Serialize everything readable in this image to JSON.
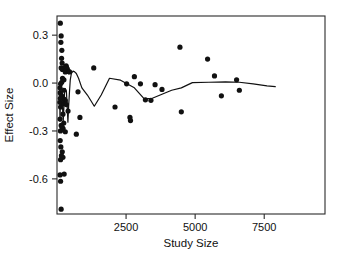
{
  "chart_data": {
    "type": "scatter",
    "title": "",
    "xlabel": "Study Size",
    "ylabel": "Effect Size",
    "xlim": [
      0,
      9700
    ],
    "ylim": [
      -0.82,
      0.42
    ],
    "grid": false,
    "legend": "none",
    "xticks": [
      2500,
      5000,
      7500
    ],
    "xtick_labels": [
      "2500",
      "5000",
      "7500"
    ],
    "yticks": [
      0.3,
      0.0,
      -0.3,
      -0.6
    ],
    "ytick_labels": [
      "0.3",
      "0.0",
      "-0.3",
      "-0.6"
    ],
    "marker": "filled-circle",
    "marker_color": "#111111",
    "line_color": "#111111",
    "series": [
      {
        "name": "studies",
        "type": "scatter",
        "points": [
          [
            120,
            0.375
          ],
          [
            150,
            0.295
          ],
          [
            140,
            0.255
          ],
          [
            175,
            0.205
          ],
          [
            165,
            0.155
          ],
          [
            185,
            0.125
          ],
          [
            150,
            0.095
          ],
          [
            195,
            0.085
          ],
          [
            300,
            0.1
          ],
          [
            330,
            0.108
          ],
          [
            345,
            0.098
          ],
          [
            375,
            0.088
          ],
          [
            300,
            0.07
          ],
          [
            420,
            0.072
          ],
          [
            455,
            0.07
          ],
          [
            200,
            0.03
          ],
          [
            250,
            0.02
          ],
          [
            170,
            0.005
          ],
          [
            130,
            -0.005
          ],
          [
            110,
            -0.03
          ],
          [
            245,
            -0.045
          ],
          [
            115,
            -0.06
          ],
          [
            150,
            -0.075
          ],
          [
            190,
            -0.085
          ],
          [
            120,
            -0.095
          ],
          [
            255,
            -0.1
          ],
          [
            300,
            -0.11
          ],
          [
            105,
            -0.12
          ],
          [
            230,
            -0.13
          ],
          [
            340,
            -0.135
          ],
          [
            130,
            -0.15
          ],
          [
            400,
            -0.175
          ],
          [
            215,
            -0.195
          ],
          [
            110,
            -0.225
          ],
          [
            245,
            -0.25
          ],
          [
            150,
            -0.265
          ],
          [
            185,
            -0.275
          ],
          [
            220,
            -0.285
          ],
          [
            125,
            -0.3
          ],
          [
            300,
            -0.305
          ],
          [
            115,
            -0.36
          ],
          [
            140,
            -0.4
          ],
          [
            190,
            -0.43
          ],
          [
            160,
            -0.455
          ],
          [
            215,
            -0.465
          ],
          [
            130,
            -0.48
          ],
          [
            110,
            -0.575
          ],
          [
            260,
            -0.57
          ],
          [
            130,
            -0.615
          ],
          [
            150,
            -0.79
          ],
          [
            760,
            -0.055
          ],
          [
            830,
            -0.215
          ],
          [
            700,
            -0.32
          ],
          [
            1330,
            0.095
          ],
          [
            2100,
            -0.15
          ],
          [
            2800,
            0.04
          ],
          [
            2520,
            -0.005
          ],
          [
            2640,
            -0.215
          ],
          [
            2660,
            -0.235
          ],
          [
            3020,
            -0.005
          ],
          [
            3200,
            -0.105
          ],
          [
            3400,
            -0.108
          ],
          [
            3550,
            -0.01
          ],
          [
            3800,
            -0.04
          ],
          [
            4450,
            0.225
          ],
          [
            4500,
            -0.18
          ],
          [
            5450,
            0.15
          ],
          [
            5700,
            0.045
          ],
          [
            5950,
            -0.08
          ],
          [
            6500,
            0.02
          ],
          [
            6600,
            -0.045
          ]
        ]
      },
      {
        "name": "trend",
        "type": "line",
        "points": [
          [
            95,
            -0.02
          ],
          [
            100,
            -0.1
          ],
          [
            108,
            -0.24
          ],
          [
            118,
            -0.15
          ],
          [
            128,
            -0.06
          ],
          [
            138,
            -0.15
          ],
          [
            150,
            -0.06
          ],
          [
            165,
            -0.09
          ],
          [
            180,
            -0.055
          ],
          [
            200,
            -0.15
          ],
          [
            225,
            -0.24
          ],
          [
            250,
            -0.15
          ],
          [
            275,
            -0.055
          ],
          [
            300,
            -0.035
          ],
          [
            340,
            -0.05
          ],
          [
            370,
            -0.15
          ],
          [
            395,
            -0.245
          ],
          [
            420,
            -0.15
          ],
          [
            450,
            -0.06
          ],
          [
            480,
            0.02
          ],
          [
            520,
            0.06
          ],
          [
            580,
            0.075
          ],
          [
            640,
            0.07
          ],
          [
            700,
            0.06
          ],
          [
            780,
            0.03
          ],
          [
            900,
            -0.03
          ],
          [
            1100,
            -0.075
          ],
          [
            1350,
            -0.145
          ],
          [
            1600,
            -0.075
          ],
          [
            1900,
            0.03
          ],
          [
            2300,
            0.018
          ],
          [
            2800,
            -0.03
          ],
          [
            3150,
            -0.098
          ],
          [
            3450,
            -0.095
          ],
          [
            3800,
            -0.07
          ],
          [
            4150,
            -0.045
          ],
          [
            4500,
            -0.03
          ],
          [
            4900,
            0.003
          ],
          [
            5500,
            0.005
          ],
          [
            6100,
            0.008
          ],
          [
            6600,
            0.005
          ],
          [
            7100,
            -0.005
          ],
          [
            7600,
            -0.018
          ],
          [
            7900,
            -0.022
          ]
        ]
      }
    ]
  }
}
